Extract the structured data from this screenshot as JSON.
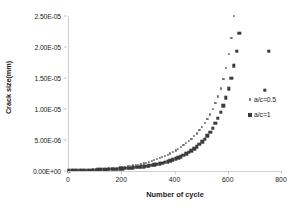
{
  "chart_data": {
    "type": "scatter",
    "title": "",
    "xlabel": "Number of cycle",
    "ylabel": "Crack size(mm)",
    "xlim": [
      0,
      800
    ],
    "ylim": [
      0,
      2.5e-05
    ],
    "xticks": [
      0,
      200,
      400,
      600,
      800
    ],
    "xtick_labels": [
      "0",
      "200",
      "400",
      "600",
      "800"
    ],
    "yticks": [
      0,
      5e-06,
      1e-05,
      1.5e-05,
      2e-05,
      2.5e-05
    ],
    "ytick_labels": [
      "0.00E+00",
      "5.00E-06",
      "1.00E-05",
      "1.50E-05",
      "2.00E-05",
      "2.50E-05"
    ],
    "grid": false,
    "legend_position": "right",
    "series": [
      {
        "name": "a/c=0.5",
        "marker": "dot",
        "color": "#6e6e6e",
        "x": [
          0,
          10,
          20,
          30,
          40,
          50,
          60,
          70,
          80,
          90,
          100,
          110,
          120,
          130,
          140,
          150,
          160,
          170,
          180,
          190,
          200,
          210,
          220,
          230,
          240,
          250,
          260,
          270,
          280,
          290,
          300,
          310,
          320,
          330,
          340,
          350,
          360,
          370,
          380,
          390,
          400,
          410,
          420,
          430,
          440,
          450,
          460,
          470,
          480,
          490,
          500,
          510,
          520,
          530,
          540,
          550,
          560,
          570,
          580,
          590,
          600,
          610,
          620,
          630
        ],
        "y": [
          1e-07,
          1.1e-07,
          1.2e-07,
          1.3e-07,
          1.45e-07,
          1.6e-07,
          1.75e-07,
          1.9e-07,
          2.1e-07,
          2.3e-07,
          2.5e-07,
          2.75e-07,
          3e-07,
          3.3e-07,
          3.6e-07,
          3.95e-07,
          4.3e-07,
          4.7e-07,
          5.15e-07,
          5.6e-07,
          6.1e-07,
          6.65e-07,
          7.25e-07,
          7.9e-07,
          8.6e-07,
          9.4e-07,
          1.02e-06,
          1.11e-06,
          1.21e-06,
          1.32e-06,
          1.44e-06,
          1.57e-06,
          1.71e-06,
          1.86e-06,
          2.03e-06,
          2.21e-06,
          2.4e-06,
          2.6e-06,
          2.82e-06,
          3.05e-06,
          3.3e-06,
          3.57e-06,
          3.85e-06,
          4.15e-06,
          4.48e-06,
          4.83e-06,
          5.2e-06,
          5.6e-06,
          6.05e-06,
          6.55e-06,
          7.1e-06,
          7.7e-06,
          8.35e-06,
          9.1e-06,
          9.95e-06,
          1.09e-05,
          1.2e-05,
          1.33e-05,
          1.48e-05,
          1.66e-05,
          1.88e-05,
          2.15e-05,
          2.5e-05,
          3e-05
        ]
      },
      {
        "name": "a/c=1",
        "marker": "square",
        "color": "#3b3b3b",
        "x": [
          0,
          10,
          20,
          30,
          40,
          50,
          60,
          70,
          80,
          90,
          100,
          110,
          120,
          130,
          140,
          150,
          160,
          170,
          180,
          190,
          200,
          210,
          220,
          230,
          240,
          250,
          260,
          270,
          280,
          290,
          300,
          310,
          320,
          330,
          340,
          350,
          360,
          370,
          380,
          390,
          400,
          410,
          420,
          430,
          440,
          450,
          460,
          470,
          480,
          490,
          500,
          510,
          520,
          530,
          540,
          550,
          560,
          570,
          580,
          590,
          600,
          610,
          620,
          630,
          640,
          650,
          660,
          670,
          680,
          690,
          700,
          710,
          720,
          735,
          750
        ],
        "y": [
          8e-08,
          8.6e-08,
          9.3e-08,
          1e-07,
          1.08e-07,
          1.17e-07,
          1.27e-07,
          1.37e-07,
          1.48e-07,
          1.6e-07,
          1.73e-07,
          1.87e-07,
          2.02e-07,
          2.19e-07,
          2.37e-07,
          2.56e-07,
          2.77e-07,
          3e-07,
          3.25e-07,
          3.52e-07,
          3.81e-07,
          4.13e-07,
          4.47e-07,
          4.85e-07,
          5.25e-07,
          5.7e-07,
          6.17e-07,
          6.7e-07,
          7.27e-07,
          7.89e-07,
          8.57e-07,
          9.3e-07,
          1.01e-06,
          1.1e-06,
          1.19e-06,
          1.3e-06,
          1.41e-06,
          1.53e-06,
          1.66e-06,
          1.81e-06,
          1.97e-06,
          2.14e-06,
          2.33e-06,
          2.54e-06,
          2.77e-06,
          3.02e-06,
          3.3e-06,
          3.6e-06,
          3.94e-06,
          4.31e-06,
          4.72e-06,
          5.18e-06,
          5.7e-06,
          6.28e-06,
          6.93e-06,
          7.67e-06,
          8.5e-06,
          9.46e-06,
          1.055e-05,
          1.182e-05,
          1.33e-05,
          1.5e-05,
          1.7e-05,
          1.935e-05,
          2.22e-05,
          2.57e-05,
          3e-05,
          3.55e-05,
          4.3e-05,
          5.3e-05,
          6.8e-05,
          9e-05,
          0.00013,
          1.3e-05,
          1.93e-05
        ]
      }
    ],
    "visible_highlight_points": [
      {
        "series": "a/c=1",
        "x": 735,
        "y": 1.3e-05
      },
      {
        "series": "a/c=1",
        "x": 750,
        "y": 1.93e-05
      },
      {
        "series": "a/c=1",
        "x": 718,
        "y": 5.3e-06
      },
      {
        "series": "a/c=0.5",
        "x": 630,
        "y": 6.1e-06
      }
    ]
  },
  "legend": {
    "entries": [
      {
        "label": "a/c=0.5",
        "marker": "dot-marker"
      },
      {
        "label": "a/c=1",
        "marker": "square-marker"
      }
    ]
  }
}
